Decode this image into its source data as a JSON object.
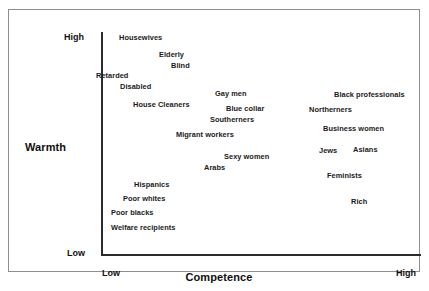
{
  "chart_data": {
    "type": "scatter",
    "title": "",
    "xlabel": "Competence",
    "ylabel": "Warmth",
    "x_ticks": [
      "Low",
      "High"
    ],
    "y_ticks": [
      "High",
      "Low"
    ],
    "xlim": [
      "Low",
      "High"
    ],
    "ylim": [
      "Low",
      "High"
    ],
    "grid": false,
    "legend": "none",
    "note": "Stereotype Content Model: social group labels placed by perceived Competence (x) and Warmth (y). Positions read from pixel coordinates and normalized to 0-1 on each axis.",
    "points": [
      {
        "label": "Housewives",
        "x_px": 118,
        "y_px": 33,
        "competence": 0.08,
        "warmth": 0.96
      },
      {
        "label": "Elderly",
        "x_px": 158,
        "y_px": 50,
        "competence": 0.21,
        "warmth": 0.88
      },
      {
        "label": "Blind",
        "x_px": 170,
        "y_px": 61,
        "competence": 0.24,
        "warmth": 0.83
      },
      {
        "label": "Retarded",
        "x_px": 95,
        "y_px": 71,
        "competence": 0.01,
        "warmth": 0.78
      },
      {
        "label": "Disabled",
        "x_px": 119,
        "y_px": 82,
        "competence": 0.08,
        "warmth": 0.73
      },
      {
        "label": "House Cleaners",
        "x_px": 132,
        "y_px": 100,
        "competence": 0.13,
        "warmth": 0.65
      },
      {
        "label": "Gay men",
        "x_px": 214,
        "y_px": 89,
        "competence": 0.38,
        "warmth": 0.7
      },
      {
        "label": "Blue collar",
        "x_px": 225,
        "y_px": 104,
        "competence": 0.42,
        "warmth": 0.63
      },
      {
        "label": "Southerners",
        "x_px": 209,
        "y_px": 115,
        "competence": 0.37,
        "warmth": 0.58
      },
      {
        "label": "Migrant workers",
        "x_px": 175,
        "y_px": 130,
        "competence": 0.26,
        "warmth": 0.51
      },
      {
        "label": "Sexy women",
        "x_px": 223,
        "y_px": 152,
        "competence": 0.41,
        "warmth": 0.41
      },
      {
        "label": "Arabs",
        "x_px": 203,
        "y_px": 163,
        "competence": 0.35,
        "warmth": 0.36
      },
      {
        "label": "Black professionals",
        "x_px": 333,
        "y_px": 90,
        "competence": 0.76,
        "warmth": 0.69
      },
      {
        "label": "Northerners",
        "x_px": 308,
        "y_px": 105,
        "competence": 0.68,
        "warmth": 0.62
      },
      {
        "label": "Business women",
        "x_px": 322,
        "y_px": 124,
        "competence": 0.72,
        "warmth": 0.54
      },
      {
        "label": "Jews",
        "x_px": 318,
        "y_px": 146,
        "competence": 0.71,
        "warmth": 0.44
      },
      {
        "label": "Asians",
        "x_px": 352,
        "y_px": 145,
        "competence": 0.81,
        "warmth": 0.44
      },
      {
        "label": "Feminists",
        "x_px": 326,
        "y_px": 171,
        "competence": 0.73,
        "warmth": 0.33
      },
      {
        "label": "Rich",
        "x_px": 350,
        "y_px": 197,
        "competence": 0.81,
        "warmth": 0.21
      },
      {
        "label": "Hispanics",
        "x_px": 133,
        "y_px": 180,
        "competence": 0.13,
        "warmth": 0.29
      },
      {
        "label": "Poor whites",
        "x_px": 122,
        "y_px": 194,
        "competence": 0.09,
        "warmth": 0.23
      },
      {
        "label": "Poor blacks",
        "x_px": 110,
        "y_px": 208,
        "competence": 0.06,
        "warmth": 0.16
      },
      {
        "label": "Welfare recipients",
        "x_px": 110,
        "y_px": 223,
        "competence": 0.06,
        "warmth": 0.09
      }
    ]
  },
  "axes": {
    "y_label": "Warmth",
    "x_label": "Competence",
    "y_high": "High",
    "y_low": "Low",
    "x_low": "Low",
    "x_high": "High"
  },
  "colors": {
    "frame": "#8e8e8e",
    "axis": "#2b2b2b",
    "text": "#1a1a1a",
    "background": "#ffffff"
  }
}
